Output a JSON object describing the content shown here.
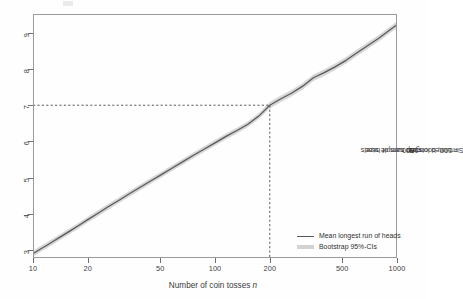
{
  "axes": {
    "x": {
      "label_prefix": "Number of coin tosses ",
      "label_italic": "n",
      "ticks": [
        "10",
        "20",
        "50",
        "100",
        "200",
        "500",
        "1000"
      ]
    },
    "y": {
      "ticks": [
        "3",
        "4",
        "5",
        "6",
        "7",
        "8",
        "9"
      ]
    },
    "right_label": {
      "part1": "Simulated longest runs of heads ",
      "it1": "N",
      "part2": " = 500, bootstrap sample size ",
      "it2": "B",
      "part3": " =1000"
    }
  },
  "legend": {
    "items": [
      {
        "label": "Mean longest run of heads",
        "key": "line-swatch",
        "color": "#585858"
      },
      {
        "label": "Bootstrap 95%-CIs",
        "key": "band-swatch",
        "color": "#d2d2d2"
      }
    ]
  },
  "colors": {
    "mean_line": "#585858",
    "ci_band": "#d4d4d4",
    "frame": "#9a9a9a",
    "reference_dash": "#4a4a4a",
    "background": "#fefefe"
  },
  "chart_data": {
    "type": "line",
    "title": "",
    "xlabel": "Number of coin tosses n",
    "ylabel": "Simulated longest runs of heads N = 500, bootstrap sample size B = 1000",
    "xscale": "log",
    "yscale": "linear",
    "xlim": [
      10,
      1000
    ],
    "ylim": [
      2.78,
      9.52
    ],
    "xticks": [
      10,
      20,
      50,
      100,
      200,
      500,
      1000
    ],
    "yticks": [
      3,
      4,
      5,
      6,
      7,
      8,
      9
    ],
    "grid": false,
    "legend_position": "bottom-right",
    "annotations": [
      {
        "type": "reference-lines",
        "style": "dashed",
        "x": 200,
        "y": 7.0,
        "note": "horizontal dashed line at y=7 from left axis to x=200; vertical dashed line at x=200 down to bottom axis"
      }
    ],
    "series": [
      {
        "name": "Mean longest run of heads",
        "color": "#585858",
        "x": [
          10,
          11,
          12,
          13,
          14,
          16,
          18,
          20,
          23,
          26,
          30,
          34,
          39,
          45,
          51,
          58,
          67,
          77,
          88,
          100,
          115,
          132,
          151,
          174,
          200,
          229,
          263,
          302,
          347,
          398,
          457,
          525,
          603,
          692,
          794,
          912,
          1000
        ],
        "y": [
          2.9,
          3.03,
          3.14,
          3.25,
          3.35,
          3.53,
          3.69,
          3.84,
          4.03,
          4.2,
          4.39,
          4.56,
          4.74,
          4.93,
          5.09,
          5.26,
          5.45,
          5.63,
          5.8,
          5.96,
          6.14,
          6.3,
          6.47,
          6.7,
          7.0,
          7.17,
          7.33,
          7.52,
          7.76,
          7.9,
          8.06,
          8.24,
          8.45,
          8.65,
          8.85,
          9.08,
          9.22
        ]
      },
      {
        "name": "Bootstrap 95%-CIs lower",
        "color": "#d4d4d4",
        "x": [
          10,
          11,
          12,
          13,
          14,
          16,
          18,
          20,
          23,
          26,
          30,
          34,
          39,
          45,
          51,
          58,
          67,
          77,
          88,
          100,
          115,
          132,
          151,
          174,
          200,
          229,
          263,
          302,
          347,
          398,
          457,
          525,
          603,
          692,
          794,
          912,
          1000
        ],
        "y": [
          2.82,
          2.95,
          3.06,
          3.17,
          3.27,
          3.45,
          3.61,
          3.76,
          3.95,
          4.12,
          4.31,
          4.48,
          4.66,
          4.85,
          5.01,
          5.18,
          5.37,
          5.55,
          5.72,
          5.88,
          6.06,
          6.22,
          6.39,
          6.62,
          6.91,
          7.08,
          7.24,
          7.43,
          7.67,
          7.81,
          7.97,
          8.15,
          8.36,
          8.56,
          8.76,
          8.99,
          9.13
        ]
      },
      {
        "name": "Bootstrap 95%-CIs upper",
        "color": "#d4d4d4",
        "x": [
          10,
          11,
          12,
          13,
          14,
          16,
          18,
          20,
          23,
          26,
          30,
          34,
          39,
          45,
          51,
          58,
          67,
          77,
          88,
          100,
          115,
          132,
          151,
          174,
          200,
          229,
          263,
          302,
          347,
          398,
          457,
          525,
          603,
          692,
          794,
          912,
          1000
        ],
        "y": [
          2.98,
          3.11,
          3.22,
          3.33,
          3.43,
          3.61,
          3.77,
          3.92,
          4.11,
          4.28,
          4.47,
          4.64,
          4.82,
          5.01,
          5.17,
          5.34,
          5.53,
          5.71,
          5.88,
          6.04,
          6.22,
          6.38,
          6.55,
          6.78,
          7.09,
          7.26,
          7.42,
          7.61,
          7.85,
          7.99,
          8.15,
          8.33,
          8.54,
          8.74,
          8.94,
          9.17,
          9.31
        ]
      }
    ]
  }
}
